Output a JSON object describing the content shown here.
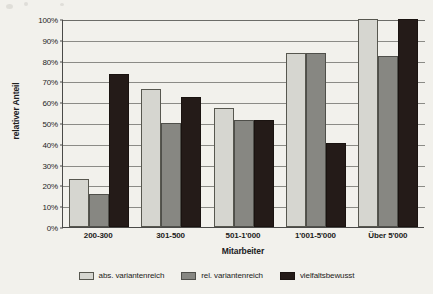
{
  "chart_data": {
    "type": "bar",
    "title": "",
    "xlabel": "Mitarbeiter",
    "ylabel": "relativer Anteil",
    "ylim": [
      0,
      100
    ],
    "ytick_labels": [
      "100%",
      "90%",
      "80%",
      "70%",
      "60%",
      "50%",
      "40%",
      "30%",
      "20%",
      "10%",
      "0%"
    ],
    "ytick_values": [
      100,
      90,
      80,
      70,
      60,
      50,
      40,
      30,
      20,
      10,
      0
    ],
    "grid": true,
    "legend_position": "bottom",
    "categories": [
      "200-300",
      "301-500",
      "501-1'000",
      "1'001-5'000",
      "Über 5'000"
    ],
    "series": [
      {
        "name": "abs. variantenreich",
        "color": "#d6d6d0",
        "values": [
          23,
          66.5,
          57,
          83.5,
          100
        ]
      },
      {
        "name": "rel. variantenreich",
        "color": "#878782",
        "values": [
          16,
          50,
          51.5,
          83.5,
          82
        ]
      },
      {
        "name": "vielfaltsbewusst",
        "color": "#241b18",
        "values": [
          73.5,
          62.5,
          51.5,
          40.5,
          100
        ]
      }
    ]
  }
}
